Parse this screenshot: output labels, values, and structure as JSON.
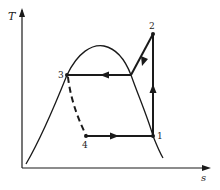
{
  "diagram": {
    "type": "T-s diagram (vapor-compression refrigeration cycle)",
    "axes": {
      "y_label": "T",
      "x_label": "s"
    },
    "points": [
      {
        "id": "1",
        "label": "1"
      },
      {
        "id": "2",
        "label": "2"
      },
      {
        "id": "3",
        "label": "3"
      },
      {
        "id": "4",
        "label": "4"
      }
    ],
    "processes": [
      {
        "from": "1",
        "to": "2",
        "style": "solid",
        "description": "isentropic compression (vertical, upward)"
      },
      {
        "from": "2",
        "to": "3",
        "style": "solid",
        "description": "desuperheating then condensation at constant T (leftward)"
      },
      {
        "from": "3",
        "to": "4",
        "style": "dashed",
        "description": "throttling/expansion"
      },
      {
        "from": "4",
        "to": "1",
        "style": "solid",
        "description": "evaporation at constant T (rightward)"
      }
    ],
    "colors": {
      "line": "#1a1a1a",
      "background": "#ffffff"
    }
  }
}
